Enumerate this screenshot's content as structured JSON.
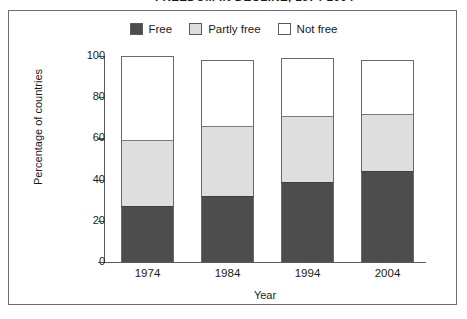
{
  "title": "FREEDOM IN DECLINE, 1974-2004",
  "frame": {
    "border_color": "#6e6e6e"
  },
  "legend": {
    "items": [
      {
        "label": "Free",
        "color": "#4d4d4d",
        "name": "legend-free"
      },
      {
        "label": "Partly free",
        "color": "#dedede",
        "name": "legend-partly-free"
      },
      {
        "label": "Not free",
        "color": "#ffffff",
        "name": "legend-not-free"
      }
    ]
  },
  "chart_data": {
    "type": "bar",
    "subtype": "stacked-bar",
    "title": "FREEDOM IN DECLINE, 1974-2004",
    "xlabel": "Year",
    "ylabel": "Percentage of countries",
    "categories": [
      "1974",
      "1984",
      "1994",
      "2004"
    ],
    "ylim": [
      0,
      100
    ],
    "yticks": [
      0,
      20,
      40,
      60,
      80,
      100
    ],
    "ytick_labels": [
      "0",
      "20",
      "40",
      "60",
      "80",
      "100"
    ],
    "grid": false,
    "legend_position": "top-center",
    "stack_order_bottom_to_top": [
      "Free",
      "Partly free",
      "Not free"
    ],
    "series": [
      {
        "name": "Free",
        "color": "#4d4d4d",
        "values": [
          27,
          32,
          39,
          44
        ]
      },
      {
        "name": "Partly free",
        "color": "#dedede",
        "values": [
          32,
          34,
          32,
          28
        ]
      },
      {
        "name": "Not free",
        "color": "#ffffff",
        "values": [
          41,
          32,
          28,
          26
        ]
      }
    ],
    "cumulative_tops": {
      "Free": [
        27,
        32,
        39,
        44
      ],
      "Partly free": [
        59,
        66,
        71,
        72
      ],
      "Not free": [
        100,
        98,
        99,
        98
      ]
    }
  }
}
